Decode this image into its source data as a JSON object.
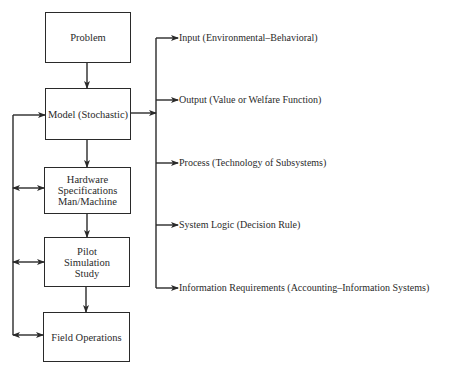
{
  "diagram": {
    "boxes": [
      {
        "id": "problem",
        "label": "Problem"
      },
      {
        "id": "model",
        "label": "Model (Stochastic)"
      },
      {
        "id": "hardware",
        "label": "Hardware\nSpecifications\nMan/Machine"
      },
      {
        "id": "pilot",
        "label": "Pilot\nSimulation\nStudy"
      },
      {
        "id": "field",
        "label": "Field Operations"
      }
    ],
    "model_components": [
      {
        "label": "Input  (Environmental–Behavioral)"
      },
      {
        "label": "Output  (Value or Welfare Function)"
      },
      {
        "label": "Process  (Technology of Subsystems)"
      },
      {
        "label": "System Logic  (Decision Rule)"
      },
      {
        "label": "Information Requirements  (Accounting–Information Systems)"
      }
    ],
    "edges": [
      {
        "from": "problem",
        "to": "model",
        "type": "arrow"
      },
      {
        "from": "model",
        "to": "hardware",
        "type": "arrow"
      },
      {
        "from": "hardware",
        "to": "pilot",
        "type": "arrow"
      },
      {
        "from": "pilot",
        "to": "field",
        "type": "arrow"
      },
      {
        "from": "feedback-bus",
        "to": "model",
        "type": "arrow"
      },
      {
        "from": "feedback-bus",
        "to": "hardware",
        "type": "double-arrow"
      },
      {
        "from": "feedback-bus",
        "to": "pilot",
        "type": "double-arrow"
      },
      {
        "from": "feedback-bus",
        "to": "field",
        "type": "double-arrow"
      },
      {
        "from": "model",
        "to": "components-bus",
        "type": "arrow"
      }
    ],
    "line_color": "#2a2a2a"
  }
}
